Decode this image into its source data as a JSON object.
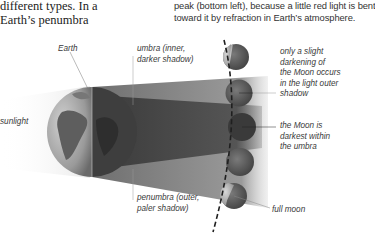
{
  "intro": {
    "left_text": "different types. In a\nEarth’s penumbra",
    "right_text": "peak (bottom left), because a little red light is bent\ntoward it by refraction in Earth’s atmosphere."
  },
  "labels": {
    "earth": "Earth",
    "sunlight": "sunlight",
    "umbra": "umbra (inner,\ndarker shadow)",
    "penumbra": "penumbra (outer,\npaler shadow)",
    "slight_darkening": "only a slight\ndarkening of\nthe Moon occurs\nin the light outer\nshadow",
    "darkest": "the Moon is\ndarkest within\nthe umbra",
    "full_moon": "full moon"
  },
  "colors": {
    "background": "#ffffff",
    "penumbra_shadow": "#8a8a8a",
    "umbra_shadow": "#4a4a4a",
    "earth_lit": "#a9a9a9",
    "earth_dark": "#3c3c3c",
    "moon_lit": "#b8b8b8",
    "moon_dark": "#5e5e5e",
    "dashed_orbit": "#222222"
  },
  "moons": [
    {
      "phase": "partly shadowed (top)",
      "cx": 236,
      "cy": 57,
      "r": 13
    },
    {
      "phase": "in penumbra",
      "cx": 239,
      "cy": 93,
      "r": 13.5
    },
    {
      "phase": "in umbra",
      "cx": 242,
      "cy": 127,
      "r": 14
    },
    {
      "phase": "in penumbra",
      "cx": 240,
      "cy": 162,
      "r": 14
    },
    {
      "phase": "full moon",
      "cx": 234,
      "cy": 196,
      "r": 13
    }
  ]
}
